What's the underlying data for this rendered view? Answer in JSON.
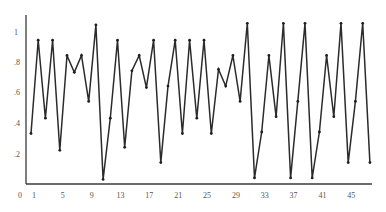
{
  "chart_data": {
    "type": "line",
    "title": "",
    "xlabel": "",
    "ylabel": "",
    "grid": false,
    "legend": null,
    "xlim": [
      1,
      48
    ],
    "ylim": [
      0,
      1.1
    ],
    "x_ticks": [
      "1",
      "5",
      "9",
      "13",
      "17",
      "21",
      "25",
      "29",
      "33",
      "37",
      "41",
      "45"
    ],
    "y_ticks": [
      "0",
      ".2",
      ".4",
      ".6",
      ".8",
      "1"
    ],
    "x": [
      1,
      2,
      3,
      4,
      5,
      6,
      7,
      8,
      9,
      10,
      11,
      12,
      13,
      14,
      15,
      16,
      17,
      18,
      19,
      20,
      21,
      22,
      23,
      24,
      25,
      26,
      27,
      28,
      29,
      30,
      31,
      32,
      33,
      34,
      35,
      36,
      37,
      38,
      39,
      40,
      41,
      42,
      43,
      44,
      45,
      46,
      47,
      48
    ],
    "series": [
      {
        "name": "series",
        "color": "#2b2b2b",
        "values": [
          0.33,
          0.94,
          0.43,
          0.94,
          0.22,
          0.84,
          0.73,
          0.84,
          0.54,
          1.04,
          0.03,
          0.43,
          0.94,
          0.24,
          0.74,
          0.84,
          0.63,
          0.94,
          0.14,
          0.64,
          0.94,
          0.33,
          0.94,
          0.43,
          0.94,
          0.33,
          0.75,
          0.64,
          0.84,
          0.54,
          1.05,
          0.04,
          0.34,
          0.84,
          0.44,
          1.05,
          0.04,
          0.54,
          1.05,
          0.04,
          0.34,
          0.84,
          0.44,
          1.05,
          0.14,
          0.54,
          1.05,
          0.14
        ]
      }
    ]
  }
}
